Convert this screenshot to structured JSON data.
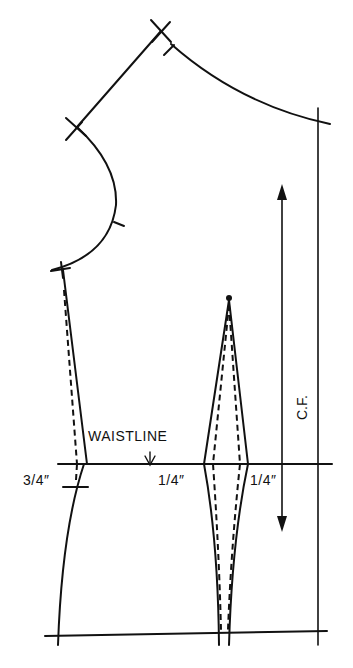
{
  "diagram": {
    "type": "sewing-pattern-bodice-front",
    "labels": {
      "waistline": "WAISTLINE",
      "side_measure": "3/4″",
      "dart_left_measure": "1/4″",
      "dart_right_measure": "1/4″",
      "center_front": "C.F."
    },
    "colors": {
      "ink": "#111111",
      "paper": "#ffffff"
    }
  }
}
